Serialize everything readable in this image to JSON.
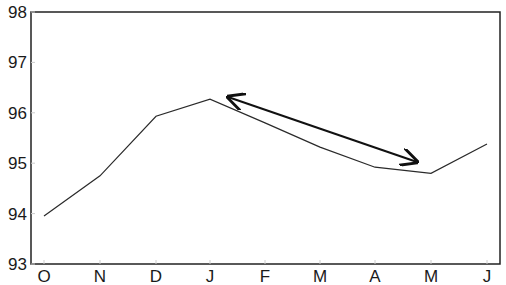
{
  "chart_data": {
    "type": "line",
    "title": "",
    "xlabel": "",
    "ylabel": "",
    "categories": [
      "O",
      "N",
      "D",
      "J",
      "F",
      "M",
      "A",
      "M",
      "J"
    ],
    "series": [
      {
        "name": "series",
        "values": [
          93.95,
          94.75,
          95.93,
          96.27,
          95.8,
          95.32,
          94.92,
          94.8,
          95.38
        ]
      }
    ],
    "ylim": [
      93,
      98
    ],
    "yticks": [
      "93",
      "94",
      "95",
      "96",
      "97",
      "98"
    ],
    "grid": false,
    "legend": null,
    "annotations": [
      {
        "type": "double-arrow",
        "from": {
          "x": "J",
          "y": 96.3
        },
        "to": {
          "x": "M",
          "y": 95.0
        }
      }
    ]
  },
  "colors": {
    "line": "#2a2a2a",
    "axis": "#222222",
    "arrow": "#111111"
  }
}
